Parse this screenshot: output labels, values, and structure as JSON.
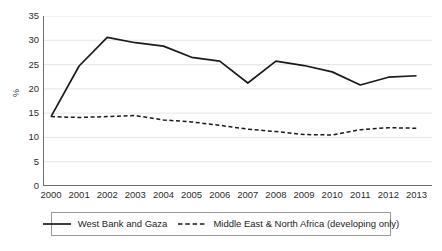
{
  "chart_data": {
    "type": "line",
    "title": "",
    "xlabel": "",
    "ylabel": "%",
    "ylim": [
      0,
      35
    ],
    "yticks": [
      0,
      5,
      10,
      15,
      20,
      25,
      30,
      35
    ],
    "grid": true,
    "grid_axis": "y",
    "legend_position": "bottom",
    "categories": [
      "2000",
      "2001",
      "2002",
      "2003",
      "2004",
      "2005",
      "2006",
      "2007",
      "2008",
      "2009",
      "2010",
      "2011",
      "2012",
      "2013"
    ],
    "series": [
      {
        "name": "West Bank and Gaza",
        "style": "solid",
        "color": "#1a1a1a",
        "values": [
          14.3,
          24.7,
          30.6,
          29.5,
          28.8,
          26.5,
          25.7,
          21.2,
          25.7,
          24.8,
          23.5,
          20.8,
          22.4,
          22.7
        ]
      },
      {
        "name": "Middle East & North Africa (developing only)",
        "style": "dashed",
        "color": "#1a1a1a",
        "values": [
          14.3,
          14.1,
          14.3,
          14.5,
          13.6,
          13.2,
          12.5,
          11.7,
          11.2,
          10.6,
          10.5,
          11.6,
          12.0,
          11.9
        ]
      }
    ]
  },
  "axes": {
    "y_title": "%",
    "y_tick_labels": [
      "35",
      "30",
      "25",
      "20",
      "15",
      "10",
      "5",
      "0"
    ],
    "x_tick_labels": [
      "2000",
      "2001",
      "2002",
      "2003",
      "2004",
      "2005",
      "2006",
      "2007",
      "2008",
      "2009",
      "2010",
      "2011",
      "2012",
      "2013"
    ]
  },
  "legend": {
    "entries": [
      {
        "label": "West Bank and Gaza",
        "style": "solid"
      },
      {
        "label": "Middle East & North Africa (developing only)",
        "style": "dashed"
      }
    ]
  },
  "colors": {
    "line": "#1a1a1a",
    "grid": "#e6e6e6",
    "axis": "#6f6f6f",
    "text": "#2b2b2b",
    "background": "#ffffff",
    "legend_border": "#9a9a9a"
  }
}
